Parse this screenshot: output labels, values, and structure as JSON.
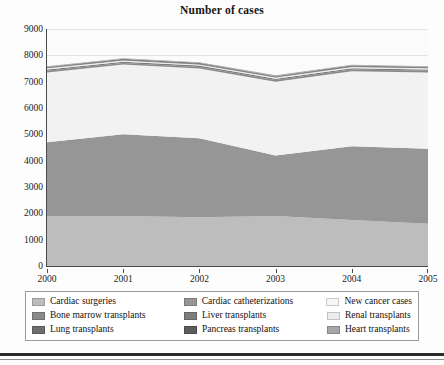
{
  "chart_data": {
    "type": "area",
    "title": "Number of cases",
    "xlabel": "",
    "ylabel": "",
    "x": [
      "2000",
      "2001",
      "2002",
      "2003",
      "2004",
      "2005"
    ],
    "categories": [
      "2000",
      "2001",
      "2002",
      "2003",
      "2004",
      "2005"
    ],
    "ylim": [
      0,
      9000
    ],
    "ytick_values": [
      0,
      1000,
      2000,
      3000,
      4000,
      5000,
      6000,
      7000,
      8000,
      9000
    ],
    "ytick_labels": [
      "0",
      "1000",
      "2000",
      "3000",
      "4000",
      "5000",
      "6000",
      "7000",
      "8000",
      "9000"
    ],
    "grid": true,
    "stacked": true,
    "legend_position": "bottom",
    "series": [
      {
        "name": "Cardiac surgeries",
        "color": "#bdbdbd",
        "values": [
          1900,
          1900,
          1850,
          1900,
          1750,
          1600
        ]
      },
      {
        "name": "Cardiac catheterizations",
        "color": "#969696",
        "values": [
          2800,
          3100,
          3000,
          2300,
          2800,
          2850
        ]
      },
      {
        "name": "New cancer cases",
        "color": "#f2f2f2",
        "values": [
          2650,
          2650,
          2650,
          2800,
          2850,
          2900
        ]
      },
      {
        "name": "Bone marrow transplants",
        "color": "#8a8a8a",
        "values": [
          60,
          60,
          60,
          60,
          60,
          60
        ]
      },
      {
        "name": "Liver transplants",
        "color": "#7d7d7d",
        "values": [
          50,
          50,
          50,
          50,
          50,
          50
        ]
      },
      {
        "name": "Renal transplants",
        "color": "#ededed",
        "values": [
          45,
          45,
          45,
          45,
          45,
          45
        ]
      },
      {
        "name": "Lung transplants",
        "color": "#6e6e6e",
        "values": [
          30,
          30,
          30,
          30,
          30,
          30
        ]
      },
      {
        "name": "Pancreas transplants",
        "color": "#5c5c5c",
        "values": [
          25,
          25,
          25,
          25,
          25,
          25
        ]
      },
      {
        "name": "Heart transplants",
        "color": "#a6a6a6",
        "values": [
          30,
          30,
          30,
          30,
          30,
          30
        ]
      }
    ]
  },
  "legend": {
    "rows": [
      [
        {
          "label": "Cardiac surgeries",
          "color": "#bdbdbd"
        },
        {
          "label": "Cardiac catheterizations",
          "color": "#969696"
        },
        {
          "label": "New cancer cases",
          "color": "#f7f7f7"
        }
      ],
      [
        {
          "label": "Bone marrow transplants",
          "color": "#8a8a8a"
        },
        {
          "label": "Liver transplants",
          "color": "#7d7d7d"
        },
        {
          "label": "Renal transplants",
          "color": "#ededed"
        }
      ],
      [
        {
          "label": "Lung transplants",
          "color": "#6e6e6e"
        },
        {
          "label": "Pancreas transplants",
          "color": "#5c5c5c"
        },
        {
          "label": "Heart transplants",
          "color": "#a6a6a6"
        }
      ]
    ]
  },
  "colors": {
    "axis": "#4a4a4a",
    "grid": "#e3e3e3",
    "text": "#1a1a1a",
    "plot_background": "#fbfbfb",
    "page_background": "#fdfdfd",
    "rule": "#2b2b2b"
  }
}
